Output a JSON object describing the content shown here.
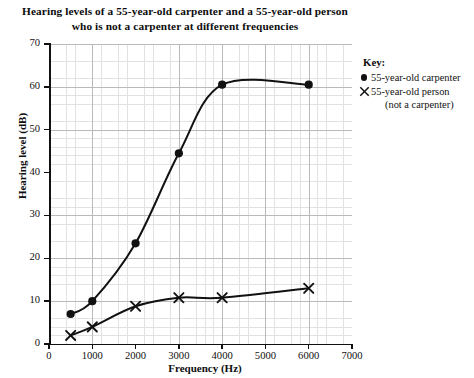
{
  "chart_data": {
    "type": "line",
    "title": "Hearing levels of a 55-year-old carpenter and a 55-year-old person who is not a carpenter at different frequencies",
    "title_line1": "Hearing levels of a 55-year-old carpenter and a 55-year-old person",
    "title_line2": "who is not a carpenter at different frequencies",
    "xlabel": "Frequency (Hz)",
    "ylabel": "Hearing level (dB)",
    "xlim": [
      0,
      7000
    ],
    "ylim": [
      0,
      70
    ],
    "xticks": [
      0,
      1000,
      2000,
      3000,
      4000,
      5000,
      6000,
      7000
    ],
    "yticks": [
      0,
      10,
      20,
      30,
      40,
      50,
      60,
      70
    ],
    "xtick_labels": [
      "0",
      "1000",
      "2000",
      "3000",
      "4000",
      "5000",
      "6000",
      "7000"
    ],
    "ytick_labels": [
      "0",
      "10",
      "20",
      "30",
      "40",
      "50",
      "60",
      "70"
    ],
    "grid": true,
    "grid_minor_step_x": 200,
    "grid_minor_step_y": 2,
    "legend_position": "right",
    "series": [
      {
        "name": "55-year-old carpenter",
        "marker": "filled-circle",
        "color": "#111111",
        "x": [
          500,
          1000,
          2000,
          3000,
          4000,
          6000
        ],
        "values": [
          7,
          10,
          23.5,
          44.5,
          60.5,
          60.5
        ]
      },
      {
        "name": "55-year-old person (not a carpenter)",
        "marker": "cross",
        "color": "#111111",
        "x": [
          500,
          1000,
          2000,
          3000,
          4000,
          6000
        ],
        "values": [
          2,
          4,
          8.8,
          10.8,
          10.8,
          13
        ]
      }
    ]
  },
  "legend": {
    "title": "Key:",
    "entries": [
      {
        "marker": "filled-circle",
        "label": "55-year-old carpenter",
        "label2": ""
      },
      {
        "marker": "cross",
        "label": "55-year-old person",
        "label2": "(not a carpenter)"
      }
    ]
  },
  "axes": {
    "x_title": "Frequency (Hz)",
    "y_title": "Hearing level (dB)"
  }
}
